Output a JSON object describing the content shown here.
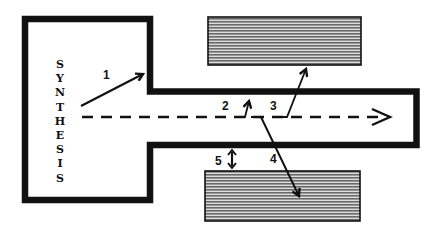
{
  "diagram": {
    "label": "SYNTHESIS",
    "label_letters": [
      "S",
      "Y",
      "N",
      "T",
      "H",
      "E",
      "S",
      "I",
      "S"
    ],
    "step_labels": {
      "step1": "1",
      "step2": "2",
      "step3": "3",
      "step4": "4",
      "step5": "5"
    },
    "colors": {
      "line": "#111111",
      "hatch_dark": "#6e6e6e",
      "hatch_light": "#d9d9d9",
      "background": "#ffffff"
    },
    "elements": {
      "synthesis_compartment": "large rectangular compartment on left, open to channel",
      "channel": "horizontal channel extending right from compartment, closed at right end",
      "upper_block": "hatched rectangle above channel",
      "lower_block": "hatched rectangle below channel",
      "main_flow": "dashed arrow from compartment to right end of channel",
      "arrow1": "arrow inside compartment pointing to upper corner of channel mouth",
      "arrow2": "short arrow from flow line toward upper channel wall",
      "arrow3": "arrow from flow line crossing upper wall into upper block",
      "arrow4": "arrow from flow line crossing lower wall into lower block",
      "arrow5": "double-headed arrow indicating gap between lower wall and lower block"
    }
  }
}
